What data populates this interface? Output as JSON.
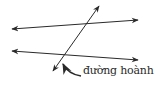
{
  "diagram": {
    "type": "parallel lines cut by a transversal",
    "label": "đường hoành",
    "colors": {
      "stroke": "#2a2a2a",
      "background": "#ffffff"
    },
    "lines": [
      {
        "name": "top-line",
        "x1": 12,
        "y1": 29,
        "x2": 138,
        "y2": 20,
        "arrows": "both"
      },
      {
        "name": "bottom-line",
        "x1": 12,
        "y1": 51,
        "x2": 138,
        "y2": 60,
        "arrows": "both"
      },
      {
        "name": "transversal",
        "x1": 53,
        "y1": 71,
        "x2": 99,
        "y2": 6,
        "arrows": "both"
      }
    ]
  }
}
